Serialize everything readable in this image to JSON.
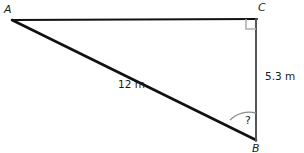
{
  "figure": {
    "type": "right-triangle-diagram",
    "background_color": "#ffffff",
    "stroke_color": "#111111",
    "vertical_stroke_color": "#555555",
    "marker_color": "#b0b0b0",
    "arc_color": "#8c8c8c",
    "vertices": {
      "a": {
        "label": "A",
        "x": 12,
        "y": 20
      },
      "b": {
        "label": "B",
        "x": 256,
        "y": 140
      },
      "c": {
        "label": "C",
        "x": 256,
        "y": 19
      }
    },
    "sides": {
      "hypotenuse": {
        "label": "12 m",
        "from": "A",
        "to": "B"
      },
      "vertical": {
        "label": "5.3 m",
        "from": "C",
        "to": "B"
      },
      "horizontal": {
        "label": "",
        "from": "A",
        "to": "C"
      }
    },
    "angles": {
      "right_angle_at": "C",
      "unknown_angle": {
        "label": "?",
        "at": "B"
      }
    }
  }
}
